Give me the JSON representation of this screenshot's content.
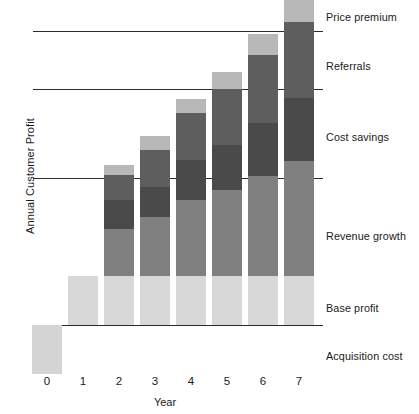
{
  "chart_data": {
    "type": "bar",
    "subtype": "stacked-waterfall",
    "title": "",
    "xlabel": "Year",
    "ylabel": "Annual Customer Profit",
    "categories": [
      "0",
      "1",
      "2",
      "3",
      "4",
      "5",
      "6",
      "7"
    ],
    "grid": true,
    "gridlines_count": 4,
    "legend_position": "right-inline-labels",
    "series": [
      {
        "name": "Acquisition cost",
        "color": "#d4d4d4",
        "values": [
          -1.0,
          0,
          0,
          0,
          0,
          0,
          0,
          0
        ]
      },
      {
        "name": "Base profit",
        "color": "#d8d8d8",
        "values": [
          0,
          1.0,
          1.0,
          1.0,
          1.0,
          1.0,
          1.0,
          1.0
        ]
      },
      {
        "name": "Revenue growth",
        "color": "#808080",
        "values": [
          0,
          0,
          0.95,
          1.2,
          1.55,
          1.75,
          2.05,
          2.35
        ]
      },
      {
        "name": "Cost savings",
        "color": "#4a4a4a",
        "values": [
          0,
          0,
          0.6,
          0.62,
          0.82,
          0.92,
          1.08,
          1.28
        ]
      },
      {
        "name": "Referrals",
        "color": "#5e5e5e",
        "values": [
          0,
          0,
          0.52,
          0.75,
          0.95,
          1.15,
          1.38,
          1.55
        ]
      },
      {
        "name": "Price premium",
        "color": "#b8b8b8",
        "values": [
          0,
          0,
          0.2,
          0.28,
          0.3,
          0.35,
          0.42,
          0.48
        ]
      }
    ],
    "annotations": [
      "Price premium",
      "Referrals",
      "Cost savings",
      "Revenue growth",
      "Base profit",
      "Acquisition cost"
    ],
    "ylim": [
      -1.2,
      6.4
    ],
    "ytick_labels": []
  },
  "labels": {
    "price_premium": "Price premium",
    "referrals": "Referrals",
    "cost_savings": "Cost savings",
    "revenue_growth": "Revenue growth",
    "base_profit": "Base profit",
    "acquisition_cost": "Acquisition cost"
  },
  "axis": {
    "y_title": "Annual Customer Profit",
    "x_title": "Year",
    "x_ticks": [
      "0",
      "1",
      "2",
      "3",
      "4",
      "5",
      "6",
      "7"
    ]
  },
  "colors": {
    "price_premium": "#b8b8b8",
    "referrals": "#5e5e5e",
    "cost_savings": "#4a4a4a",
    "revenue_growth": "#808080",
    "base_profit": "#d8d8d8",
    "acquisition_cost": "#d4d4d4",
    "gridline": "#2b2b2b",
    "text": "#1a1a1a",
    "background": "#ffffff"
  }
}
